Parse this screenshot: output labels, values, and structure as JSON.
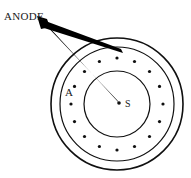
{
  "figure": {
    "background_color": "#ffffff",
    "ink_color": "#101010",
    "width": 191,
    "height": 178
  },
  "labels": {
    "anode": "ANODE",
    "annulus": "A",
    "source": "S"
  },
  "geometry": {
    "center": {
      "x": 117,
      "y": 104
    },
    "outer_circle_radius": 66,
    "middle_circle_radius": 57,
    "inner_circle_radius": 33,
    "dot_ring_radius": 46,
    "dot_count": 16,
    "dot_radius": 1.6,
    "source_dot_radius": 1.7,
    "stroke_width": 1.3
  },
  "pointer": {
    "apex": {
      "x": 41,
      "y": 21
    },
    "target_source": {
      "x": 118,
      "y": 102
    },
    "target_ring_dot": {
      "x": 122,
      "y": 52
    },
    "color": "#000000"
  },
  "annotations": {
    "anode_label_position": {
      "x": 4,
      "y": 19
    },
    "annulus_label_position": {
      "x": 66,
      "y": 95
    },
    "source_label_position": {
      "x": 126,
      "y": 106
    }
  }
}
